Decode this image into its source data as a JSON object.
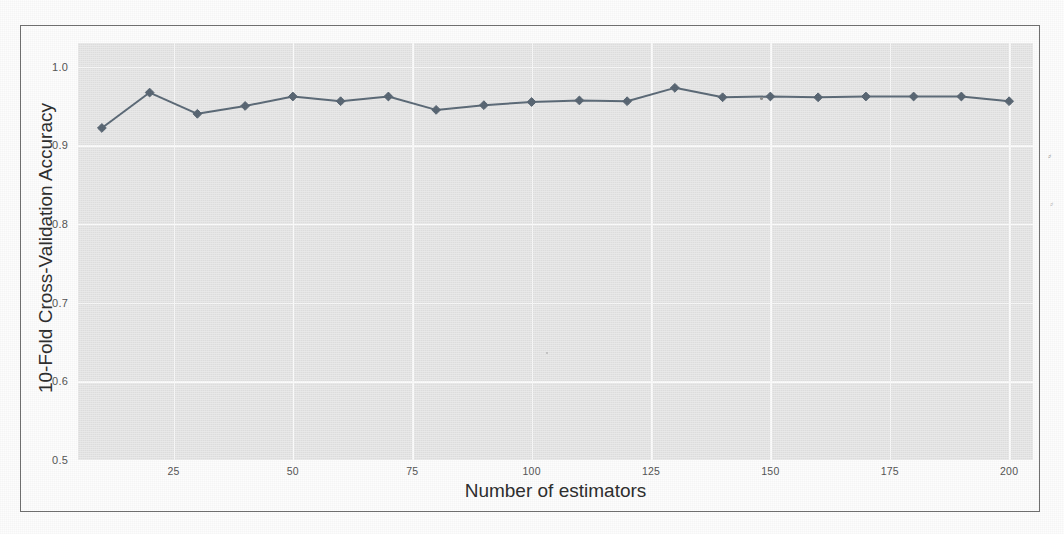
{
  "chart_data": {
    "type": "line",
    "title": "",
    "xlabel": "Number of estimators",
    "ylabel": "10-Fold Cross-Validation Accuracy",
    "x": [
      10,
      20,
      30,
      40,
      50,
      60,
      70,
      80,
      90,
      100,
      110,
      120,
      130,
      140,
      150,
      160,
      170,
      180,
      190,
      200
    ],
    "values": [
      0.922,
      0.967,
      0.94,
      0.95,
      0.962,
      0.956,
      0.962,
      0.945,
      0.951,
      0.955,
      0.957,
      0.956,
      0.973,
      0.961,
      0.962,
      0.961,
      0.962,
      0.962,
      0.962,
      0.956
    ],
    "series": [
      {
        "name": "10-fold CV accuracy",
        "values": [
          0.922,
          0.967,
          0.94,
          0.95,
          0.962,
          0.956,
          0.962,
          0.945,
          0.951,
          0.955,
          0.957,
          0.956,
          0.973,
          0.961,
          0.962,
          0.961,
          0.962,
          0.962,
          0.962,
          0.956
        ]
      }
    ],
    "xlim": [
      5,
      205
    ],
    "ylim": [
      0.5,
      1.03
    ],
    "xticks": [
      25,
      50,
      75,
      100,
      125,
      150,
      175,
      200
    ],
    "xticklabels": [
      "25",
      "50",
      "75",
      "100",
      "125",
      "150",
      "175",
      "200"
    ],
    "yticks": [
      0.5,
      0.6,
      0.7,
      0.8,
      0.9,
      1.0
    ],
    "yticklabels": [
      "0.5",
      "0.6",
      "0.7",
      "0.8",
      "0.9",
      "1.0"
    ],
    "grid": true,
    "grid_color": "#fbfbfb",
    "legend": "none",
    "line_color": "#5d6b78",
    "marker_color": "#5a6774",
    "marker": "diamond",
    "plot_bgcolor": "#e7e7e7",
    "figure_bgcolor": "#fdfdfd"
  },
  "figure": {
    "border_color": "#6e6e6e"
  },
  "artifacts": {
    "edge_mark_right": "⸗"
  }
}
